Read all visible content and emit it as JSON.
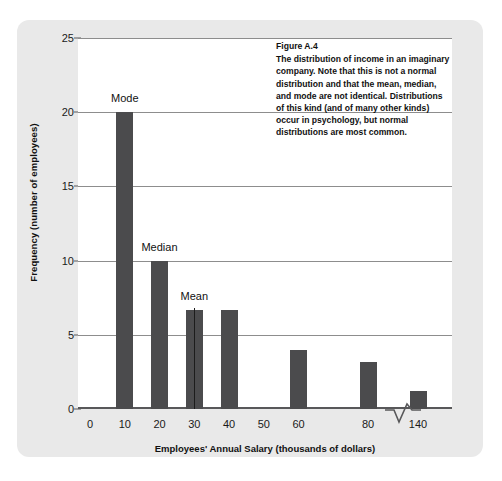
{
  "figure": {
    "caption_title": "Figure A.4",
    "caption_body": "The distribution of income in an imaginary company. Note that this is not a normal distribution and that the mean, median, and mode are not identical. Distributions of this kind (and of many other kinds) occur in psychology, but normal distributions are most common.",
    "card_color": "#e9e9e9",
    "panel_color": "#ffffff",
    "bar_color": "#4b4b4d",
    "grid_color": "#8d8d8d",
    "axis_color": "#58585a"
  },
  "chart_data": {
    "type": "bar",
    "title": "Figure A.4",
    "xlabel": "Employees' Annual Salary (thousands of dollars)",
    "ylabel": "Frequency (number of employees)",
    "categories": [
      "10",
      "20",
      "30",
      "40",
      "60",
      "80",
      "140"
    ],
    "values": [
      20,
      10,
      6.7,
      6.7,
      4,
      3.2,
      1.2
    ],
    "x_tick_labels": [
      "0",
      "10",
      "20",
      "30",
      "40",
      "50",
      "60",
      "80",
      "140"
    ],
    "x_tick_values": [
      0,
      10,
      20,
      30,
      40,
      50,
      60,
      80,
      140
    ],
    "y_tick_labels": [
      "0",
      "5",
      "10",
      "15",
      "20",
      "25"
    ],
    "y_tick_values": [
      0,
      5,
      10,
      15,
      20,
      25
    ],
    "ylim": [
      0,
      25
    ],
    "grid": true,
    "legend": "none",
    "axis_break": {
      "between": [
        80,
        140
      ],
      "style": "zigzag"
    },
    "annotations": [
      {
        "label": "Mode",
        "at_category": "10",
        "value": 20
      },
      {
        "label": "Median",
        "at_category": "20",
        "value": 10
      },
      {
        "label": "Mean",
        "at_category": "30",
        "value": 6.7
      }
    ]
  },
  "labels": {
    "mode": "Mode",
    "median": "Median",
    "mean": "Mean"
  }
}
